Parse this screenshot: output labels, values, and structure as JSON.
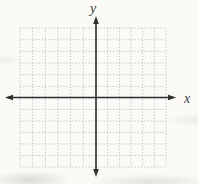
{
  "figure": {
    "x_axis_label": "x",
    "y_axis_label": "y"
  },
  "colors": {
    "background": "#fbfaf7",
    "grid_line": "#b4b8bf",
    "axis": "#2e2e2e",
    "label": "#3c3c3c"
  },
  "chart_data": {
    "type": "line",
    "title": "",
    "subtitle": "",
    "xlabel": "x",
    "ylabel": "y",
    "xlim": [
      -6,
      6
    ],
    "ylim": [
      -6,
      6
    ],
    "grid": "on",
    "grid_style": "dotted",
    "grid_cells": {
      "columns": 12,
      "rows": 12
    },
    "tick_labels": "none",
    "legend": "none",
    "series": [],
    "annotations": []
  }
}
